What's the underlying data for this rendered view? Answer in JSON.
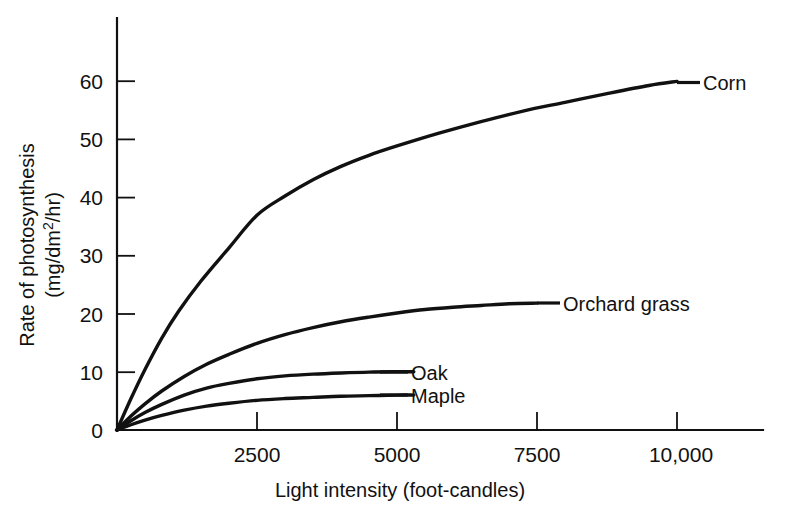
{
  "chart_data": {
    "type": "line",
    "title": "",
    "xlabel": "Light intensity (foot-candles)",
    "ylabel_line1": "Rate of photosynthesis",
    "ylabel_line2_pre": "(mg/dm",
    "ylabel_line2_sup": "2",
    "ylabel_line2_post": "/hr)",
    "xlim": [
      0,
      11500
    ],
    "ylim": [
      0,
      66
    ],
    "grid": false,
    "legend_position": "inline-right-of-curve",
    "xticks": [
      {
        "value": 2500,
        "label": "2500"
      },
      {
        "value": 5000,
        "label": "5000"
      },
      {
        "value": 7500,
        "label": "7500"
      },
      {
        "value": 10000,
        "label": "10,000"
      }
    ],
    "yticks": [
      {
        "value": 0,
        "label": "0"
      },
      {
        "value": 10,
        "label": "10"
      },
      {
        "value": 20,
        "label": "20"
      },
      {
        "value": 30,
        "label": "30"
      },
      {
        "value": 40,
        "label": "40"
      },
      {
        "value": 50,
        "label": "50"
      },
      {
        "value": 60,
        "label": "60"
      }
    ],
    "series": [
      {
        "name": "Corn",
        "label": "Corn",
        "color": "#111111",
        "x": [
          0,
          250,
          500,
          800,
          1100,
          1500,
          2000,
          2500,
          3000,
          3500,
          4000,
          4500,
          5000,
          5750,
          6500,
          7250,
          8000,
          8750,
          9500,
          10000
        ],
        "y": [
          0,
          5.4,
          10.4,
          15.8,
          20.4,
          25.6,
          31.3,
          36.9,
          40.2,
          43.0,
          45.3,
          47.2,
          48.8,
          51.0,
          53.0,
          54.8,
          56.3,
          57.8,
          59.2,
          59.9
        ]
      },
      {
        "name": "Orchard grass",
        "label": "Orchard grass",
        "color": "#111111",
        "x": [
          0,
          250,
          500,
          800,
          1200,
          1600,
          2000,
          2500,
          3000,
          3500,
          4000,
          4500,
          5000,
          5500,
          6000,
          6500,
          7000,
          7500
        ],
        "y": [
          0,
          2.4,
          4.5,
          6.7,
          9.2,
          11.3,
          13.0,
          14.9,
          16.4,
          17.6,
          18.6,
          19.4,
          20.1,
          20.7,
          21.1,
          21.4,
          21.7,
          21.8
        ]
      },
      {
        "name": "Oak",
        "label": "Oak",
        "color": "#111111",
        "x": [
          0,
          250,
          500,
          800,
          1200,
          1600,
          2000,
          2500,
          3000,
          3500,
          4000,
          4500,
          5000,
          5300
        ],
        "y": [
          0,
          1.6,
          3.0,
          4.4,
          6.0,
          7.2,
          8.0,
          8.8,
          9.3,
          9.6,
          9.8,
          9.95,
          10.0,
          10.0
        ]
      },
      {
        "name": "Maple",
        "label": "Maple",
        "color": "#111111",
        "x": [
          0,
          250,
          500,
          800,
          1200,
          1600,
          2000,
          2500,
          3000,
          3500,
          4000,
          4500,
          5000,
          5300
        ],
        "y": [
          0,
          0.9,
          1.7,
          2.5,
          3.4,
          4.1,
          4.6,
          5.1,
          5.4,
          5.6,
          5.8,
          5.9,
          6.0,
          6.0
        ]
      }
    ]
  },
  "axes": {
    "x_title": "Light intensity (foot-candles)",
    "y_title_line1": "Rate of photosynthesis",
    "y_title_line2": "(mg/dm2/hr)"
  }
}
